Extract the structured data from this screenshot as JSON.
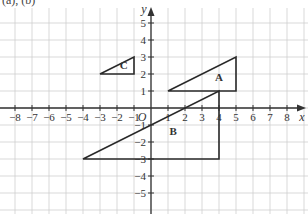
{
  "header": {
    "text": "(a), (b)"
  },
  "chart_data": {
    "type": "coordinate-grid",
    "title": "(a), (b)",
    "xlabel": "x",
    "ylabel": "y",
    "origin_label": "O",
    "xlim": [
      -9,
      9
    ],
    "ylim": [
      -6,
      6
    ],
    "grid": true,
    "x_ticks": [
      -8,
      -7,
      -6,
      -5,
      -4,
      -3,
      -2,
      -1,
      1,
      2,
      3,
      4,
      5,
      6,
      7,
      8
    ],
    "y_ticks": [
      -5,
      -4,
      -3,
      -2,
      -1,
      1,
      2,
      3,
      4,
      5
    ],
    "shapes": [
      {
        "label": "A",
        "type": "triangle",
        "vertices": [
          [
            1,
            1
          ],
          [
            5,
            1
          ],
          [
            5,
            3
          ]
        ],
        "label_pos": [
          4,
          1.6
        ]
      },
      {
        "label": "B",
        "type": "triangle",
        "vertices": [
          [
            -4,
            -3
          ],
          [
            4,
            -3
          ],
          [
            4,
            1
          ]
        ],
        "label_pos": [
          1.3,
          -1.6
        ]
      },
      {
        "label": "C",
        "type": "triangle",
        "vertices": [
          [
            -3,
            2
          ],
          [
            -1,
            2
          ],
          [
            -1,
            3
          ]
        ],
        "label_pos": [
          -1.6,
          2.3
        ]
      }
    ]
  },
  "colors": {
    "grid": "#cfcfcf",
    "axis": "#333333",
    "shape_stroke": "#2a2a2a"
  }
}
